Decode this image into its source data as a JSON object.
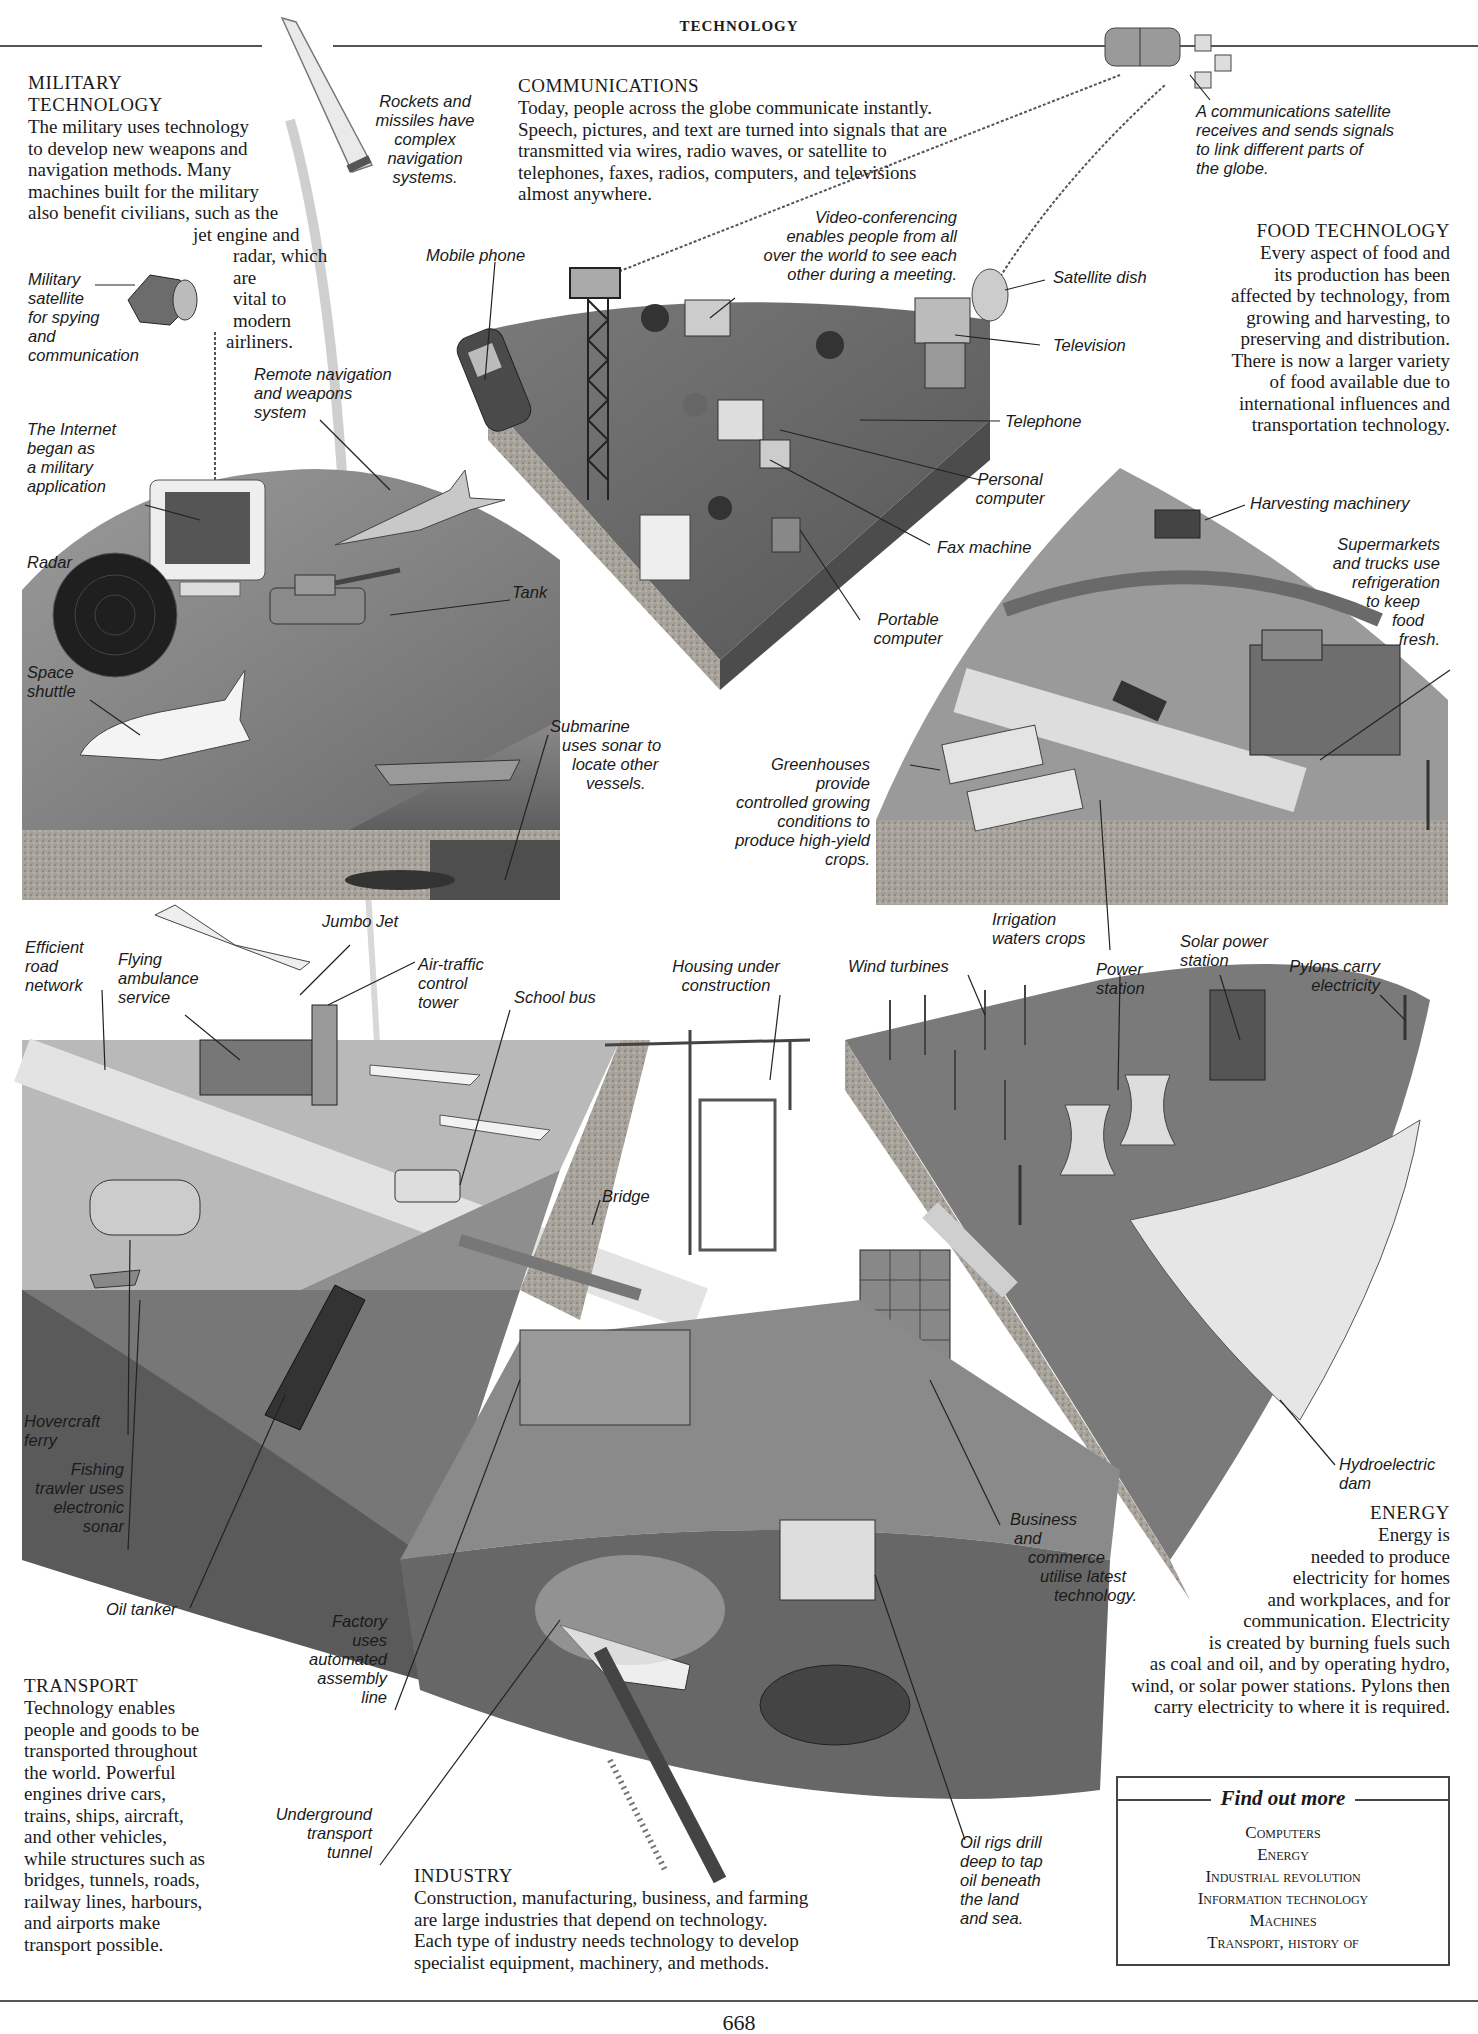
{
  "running_head": "TECHNOLOGY",
  "page_number": "668",
  "sections": {
    "military": {
      "title": "MILITARY TECHNOLOGY",
      "title_line1": "MILITARY",
      "title_line2": "TECHNOLOGY",
      "body_lines": [
        "The military uses technology",
        "to develop new weapons and",
        "navigation methods. Many",
        "machines built for the military",
        "also benefit civilians, such as the",
        "jet engine and",
        "radar, which are",
        "vital to modern",
        "airliners."
      ]
    },
    "communications": {
      "title": "COMMUNICATIONS",
      "body_lines": [
        "Today, people across the globe communicate instantly.",
        "Speech, pictures, and text are turned into signals that are",
        "transmitted via wires, radio waves, or satellite to",
        "telephones, faxes, radios, computers, and televisions",
        "almost anywhere."
      ]
    },
    "food": {
      "title": "FOOD TECHNOLOGY",
      "body_lines": [
        "Every aspect of food and",
        "its production has been",
        "affected by technology, from",
        "growing and harvesting, to",
        "preserving and distribution.",
        "There is now a larger variety",
        "of food available due to",
        "international influences and",
        "transportation technology."
      ]
    },
    "energy": {
      "title": "ENERGY",
      "body_lines": [
        "Energy is",
        "needed to produce",
        "electricity for homes",
        "and workplaces, and for",
        "communication. Electricity",
        "is created by burning fuels such",
        "as coal and oil, and by operating hydro,",
        "wind, or solar power stations. Pylons then",
        "carry electricity to where it is required."
      ]
    },
    "transport": {
      "title": "TRANSPORT",
      "body_lines": [
        "Technology enables",
        "people and goods to be",
        "transported throughout",
        "the world. Powerful",
        "engines drive cars,",
        "trains, ships, aircraft,",
        "and other vehicles,",
        "while structures such as",
        "bridges, tunnels, roads,",
        "railway lines, harbours,",
        "and airports make",
        "transport possible."
      ]
    },
    "industry": {
      "title": "INDUSTRY",
      "body_lines": [
        "Construction, manufacturing, business, and farming",
        "are large industries that depend on technology.",
        "Each type of industry needs technology to develop",
        "specialist equipment, machinery, and methods."
      ]
    }
  },
  "labels": {
    "rockets": [
      "Rockets and",
      "missiles have",
      "complex",
      "navigation",
      "systems."
    ],
    "military_satellite": [
      "Military",
      "satellite",
      "for spying",
      "and",
      "communication"
    ],
    "remote_navigation": [
      "Remote navigation",
      "and weapons",
      "system"
    ],
    "internet": [
      "The Internet",
      "began as",
      "a military",
      "application"
    ],
    "radar": [
      "Radar"
    ],
    "tank": [
      "Tank"
    ],
    "space_shuttle": [
      "Space",
      "shuttle"
    ],
    "submarine": [
      "Submarine",
      "uses sonar to",
      "locate other",
      "vessels."
    ],
    "comm_satellite": [
      "A communications satellite",
      "receives and sends signals",
      "to link different parts of",
      "the globe."
    ],
    "mobile_phone": [
      "Mobile phone"
    ],
    "video_conf": [
      "Video-conferencing",
      "enables people from all",
      "over the world to see each",
      "other during a meeting."
    ],
    "satellite_dish": [
      "Satellite dish"
    ],
    "television": [
      "Television"
    ],
    "telephone": [
      "Telephone"
    ],
    "personal_computer": [
      "Personal",
      "computer"
    ],
    "fax_machine": [
      "Fax machine"
    ],
    "portable_computer": [
      "Portable",
      "computer"
    ],
    "harvesting": [
      "Harvesting machinery"
    ],
    "supermarkets": [
      "Supermarkets",
      "and trucks use",
      "refrigeration",
      "to keep",
      "food",
      "fresh."
    ],
    "greenhouses": [
      "Greenhouses",
      "provide",
      "controlled growing",
      "conditions to",
      "produce high-yield",
      "crops."
    ],
    "irrigation": [
      "Irrigation",
      "waters crops"
    ],
    "jumbo_jet": [
      "Jumbo Jet"
    ],
    "efficient_road": [
      "Efficient",
      "road",
      "network"
    ],
    "flying_ambulance": [
      "Flying",
      "ambulance",
      "service"
    ],
    "air_traffic": [
      "Air-traffic",
      "control",
      "tower"
    ],
    "school_bus": [
      "School bus"
    ],
    "housing": [
      "Housing under",
      "construction"
    ],
    "wind_turbines": [
      "Wind turbines"
    ],
    "power_station": [
      "Power",
      "station"
    ],
    "solar_power": [
      "Solar power",
      "station"
    ],
    "pylons": [
      "Pylons carry",
      "electricity"
    ],
    "bridge": [
      "Bridge"
    ],
    "hovercraft": [
      "Hovercraft",
      "ferry"
    ],
    "fishing_trawler": [
      "Fishing",
      "trawler uses",
      "electronic",
      "sonar"
    ],
    "oil_tanker": [
      "Oil tanker"
    ],
    "factory": [
      "Factory",
      "uses",
      "automated",
      "assembly",
      "line"
    ],
    "underground": [
      "Underground",
      "transport",
      "tunnel"
    ],
    "oil_rigs": [
      "Oil rigs drill",
      "deep to tap",
      "oil beneath",
      "the land",
      "and sea."
    ],
    "business": [
      "Business",
      "and",
      "commerce",
      "utilise latest",
      "technology."
    ],
    "hydroelectric": [
      "Hydroelectric",
      "dam"
    ]
  },
  "find_out_more": {
    "title": "Find out more",
    "items": [
      "Computers",
      "Energy",
      "Industrial revolution",
      "Information technology",
      "Machines",
      "Transport, history of"
    ]
  },
  "colors": {
    "ground_dark": "#6e6e6e",
    "ground_mid": "#8c8c8c",
    "ground_light": "#b8b8b8",
    "soil": "#a9a49c",
    "rule": "#555555"
  }
}
